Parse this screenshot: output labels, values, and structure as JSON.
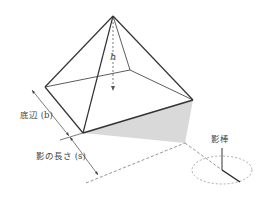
{
  "diagram": {
    "labels": {
      "height": "h",
      "base": "底辺 (b)",
      "shadow_length": "影の長さ (s)",
      "rod": "影棒"
    },
    "colors": {
      "line": "#333333",
      "shadow_fill": "#d9d9d9",
      "dashed": "#666666"
    }
  }
}
